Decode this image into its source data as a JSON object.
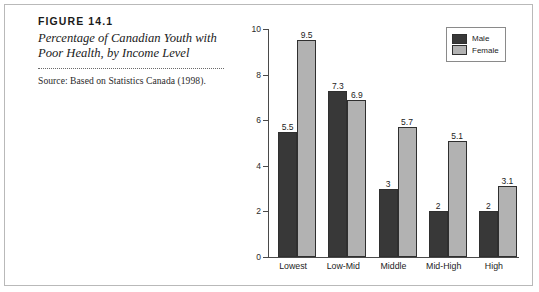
{
  "figure": {
    "number": "FIGURE 14.1",
    "title": "Percentage of Canadian Youth with Poor Health, by Income Level",
    "source": "Source: Based on Statistics Canada (1998)."
  },
  "chart_data": {
    "type": "bar",
    "title": "Percentage of Canadian Youth with Poor Health, by Income Level",
    "xlabel": "",
    "ylabel": "",
    "ylim": [
      0,
      10
    ],
    "yticks": [
      "0",
      "2",
      "4",
      "6",
      "8",
      "10"
    ],
    "grid": false,
    "legend_position": "top-right",
    "categories": [
      "Lowest",
      "Low-Mid",
      "Middle",
      "Mid-High",
      "High"
    ],
    "series": [
      {
        "name": "Male",
        "color": "#383838",
        "values": [
          5.5,
          7.3,
          3,
          2,
          2
        ],
        "labels": [
          "5.5",
          "7.3",
          "3",
          "2",
          "2"
        ]
      },
      {
        "name": "Female",
        "color": "#b2b2b2",
        "values": [
          9.5,
          6.9,
          5.7,
          5.1,
          3.1
        ],
        "labels": [
          "9.5",
          "6.9",
          "5.7",
          "5.1",
          "3.1"
        ]
      }
    ]
  }
}
